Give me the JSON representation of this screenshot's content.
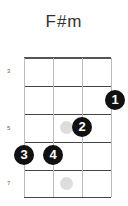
{
  "chord": {
    "name": "F#m",
    "fret_labels": [
      "3",
      "5",
      "7"
    ],
    "fingers": [
      {
        "label": "1",
        "string": 4,
        "fret": 4
      },
      {
        "label": "2",
        "string": 3,
        "fret": 5
      },
      {
        "label": "3",
        "string": 1,
        "fret": 6
      },
      {
        "label": "4",
        "string": 2,
        "fret": 6
      }
    ],
    "ghost_markers": [
      {
        "fret": 5,
        "position": "between strings 2-3"
      },
      {
        "fret": 7,
        "position": "between strings 2-3"
      }
    ]
  }
}
